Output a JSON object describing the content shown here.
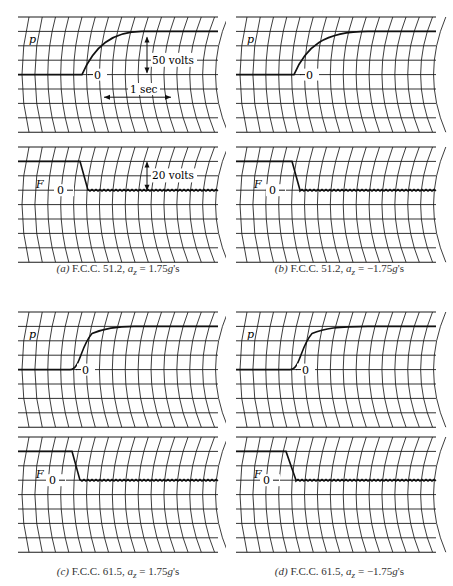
{
  "chart_data": [
    {
      "type": "line",
      "id": "a",
      "title": "(a) F.C.C. 51.2, a_z = 1.75g's",
      "caption_letter": "(a)",
      "caption_text": "F.C.C. 51.2, ",
      "caption_var": "a",
      "caption_sub": "z",
      "caption_value": " = 1.75",
      "caption_g": "g",
      "caption_unit": "'s",
      "traces": [
        {
          "name": "p",
          "label": "p",
          "zero_label": "0",
          "kind": "rise",
          "start_frac": 0.32,
          "end_frac": 0.62,
          "scale": "50 volts"
        },
        {
          "name": "F",
          "label": "F",
          "zero_label": "0",
          "kind": "fall",
          "start_frac": 0.31,
          "end_frac": 0.35,
          "scale": "20 volts"
        }
      ],
      "annotations": {
        "voltage_p": "50 volts",
        "voltage_F": "20 volts",
        "time": "1 sec"
      }
    },
    {
      "type": "line",
      "id": "b",
      "title": "(b) F.C.C. 51.2, a_z = -1.75g's",
      "caption_letter": "(b)",
      "caption_text": "F.C.C. 51.2, ",
      "caption_var": "a",
      "caption_sub": "z",
      "caption_value": " = −1.75",
      "caption_g": "g",
      "caption_unit": "'s",
      "traces": [
        {
          "name": "p",
          "label": "p",
          "zero_label": "0",
          "kind": "rise",
          "start_frac": 0.29,
          "end_frac": 0.66
        },
        {
          "name": "F",
          "label": "F",
          "zero_label": "0",
          "kind": "fall",
          "start_frac": 0.28,
          "end_frac": 0.32
        }
      ]
    },
    {
      "type": "line",
      "id": "c",
      "title": "(c) F.C.C. 61.5, a_z = 1.75g's",
      "caption_letter": "(c)",
      "caption_text": "F.C.C. 61.5, ",
      "caption_var": "a",
      "caption_sub": "z",
      "caption_value": " = 1.75",
      "caption_g": "g",
      "caption_unit": "'s",
      "traces": [
        {
          "name": "p",
          "label": "p",
          "zero_label": "0",
          "kind": "rise_s",
          "start_frac": 0.26,
          "end_frac": 0.58
        },
        {
          "name": "F",
          "label": "F",
          "zero_label": "0",
          "kind": "fall",
          "start_frac": 0.27,
          "end_frac": 0.31
        }
      ]
    },
    {
      "type": "line",
      "id": "d",
      "title": "(d) F.C.C. 61.5, a_z = -1.75g's",
      "caption_letter": "(d)",
      "caption_text": "F.C.C. 61.5, ",
      "caption_var": "a",
      "caption_sub": "z",
      "caption_value": " = −1.75",
      "caption_g": "g",
      "caption_unit": "'s",
      "traces": [
        {
          "name": "p",
          "label": "p",
          "zero_label": "0",
          "kind": "rise_s",
          "start_frac": 0.27,
          "end_frac": 0.66
        },
        {
          "name": "F",
          "label": "F",
          "zero_label": "0",
          "kind": "fall",
          "start_frac": 0.25,
          "end_frac": 0.3
        }
      ]
    }
  ],
  "layout": {
    "grid_color": "#1a1a1a",
    "trace_color": "#111111",
    "horizontal_lines": 9,
    "vertical_lines": 16
  }
}
